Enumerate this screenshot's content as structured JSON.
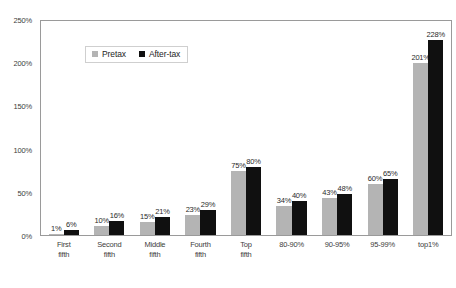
{
  "chart_data": {
    "type": "bar",
    "title": "",
    "xlabel": "",
    "ylabel": "",
    "ylim": [
      0,
      250
    ],
    "grid": false,
    "legend_position": "top-left",
    "y_ticks": [
      "0%",
      "50%",
      "100%",
      "150%",
      "200%",
      "250%"
    ],
    "y_tick_values": [
      0,
      50,
      100,
      150,
      200,
      250
    ],
    "categories": [
      "First\nfifth",
      "Second\nfifth",
      "Middle\nfifth",
      "Fourth\nfifth",
      "Top\nfifth",
      "80-90%",
      "90-95%",
      "95-99%",
      "top1%"
    ],
    "series": [
      {
        "name": "Pretax",
        "color": "#b4b4b4",
        "values": [
          1,
          10,
          15,
          23,
          75,
          34,
          43,
          60,
          201
        ],
        "labels": [
          "1%",
          "10%",
          "15%",
          "23%",
          "75%",
          "34%",
          "43%",
          "60%",
          "201%"
        ]
      },
      {
        "name": "After-tax",
        "color": "#101010",
        "values": [
          6,
          16,
          21,
          29,
          80,
          40,
          48,
          65,
          228
        ],
        "labels": [
          "6%",
          "16%",
          "21%",
          "29%",
          "80%",
          "40%",
          "48%",
          "65%",
          "228%"
        ]
      }
    ]
  }
}
